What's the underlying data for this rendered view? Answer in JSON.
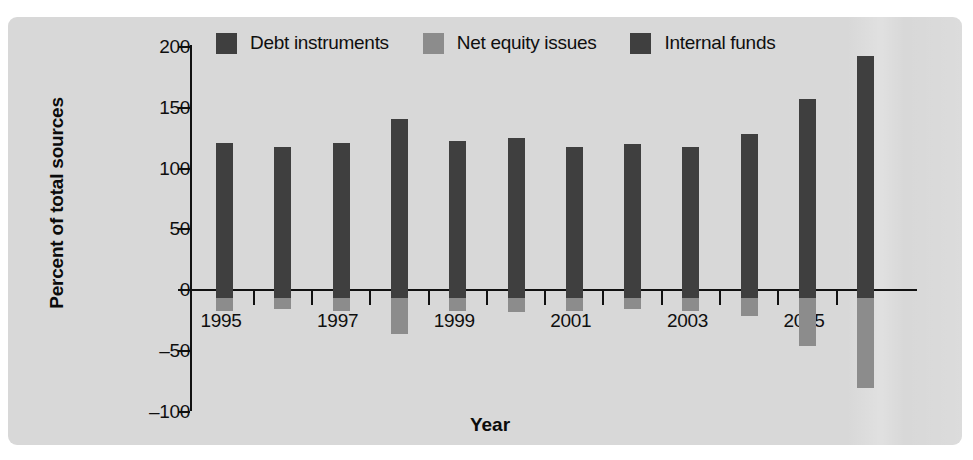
{
  "chart_data": {
    "type": "bar",
    "title": "",
    "xlabel": "Year",
    "ylabel": "Percent of total sources",
    "categories": [
      "1995",
      "1996",
      "1997",
      "1998",
      "1999",
      "2000",
      "2001",
      "2002",
      "2003",
      "2004",
      "2005",
      "2006"
    ],
    "x_tick_labels": [
      "1995",
      "1997",
      "1999",
      "2001",
      "2003",
      "2005"
    ],
    "y_tick_labels": [
      "200",
      "150",
      "100",
      "50",
      "0",
      "–50",
      "–100"
    ],
    "y_tick_values": [
      200,
      150,
      100,
      50,
      0,
      -50,
      -100
    ],
    "ylim": [
      -100,
      200
    ],
    "grid": false,
    "legend_position": "top",
    "series": [
      {
        "name": "Debt instruments",
        "color": "#3f3f3f",
        "values": [
          121,
          118,
          121,
          141,
          123,
          125,
          118,
          120,
          118,
          128,
          157,
          193
        ]
      },
      {
        "name": "Net equity issues",
        "color": "#8c8c8c",
        "values": [
          -17,
          -16,
          -17,
          -36,
          -17,
          -18,
          -17,
          -16,
          -17,
          -21,
          -46,
          -81
        ]
      },
      {
        "name": "Internal funds",
        "color": "#3f3f3f",
        "values": [
          121,
          118,
          121,
          141,
          123,
          125,
          118,
          120,
          118,
          128,
          157,
          193
        ]
      }
    ]
  },
  "legend": {
    "items": [
      {
        "label": "Debt instruments",
        "color": "#3f3f3f"
      },
      {
        "label": "Net equity issues",
        "color": "#8c8c8c"
      },
      {
        "label": "Internal funds",
        "color": "#3f3f3f"
      }
    ]
  },
  "axes": {
    "y_title": "Percent of total sources",
    "x_title": "Year"
  }
}
